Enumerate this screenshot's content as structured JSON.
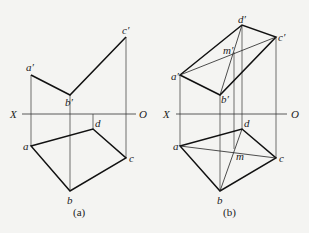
{
  "figures": [
    {
      "id": "a",
      "caption": "(a)",
      "axis": {
        "left_label": "X",
        "right_label": "O"
      },
      "front_view": {
        "points": [
          {
            "name": "a'",
            "x": 31,
            "y": 75
          },
          {
            "name": "b'",
            "x": 70,
            "y": 95
          },
          {
            "name": "c'",
            "x": 126,
            "y": 37
          }
        ]
      },
      "top_view": {
        "points": [
          {
            "name": "a",
            "x": 31,
            "y": 146
          },
          {
            "name": "b",
            "x": 70,
            "y": 191
          },
          {
            "name": "c",
            "x": 126,
            "y": 158
          },
          {
            "name": "d",
            "x": 93,
            "y": 129
          }
        ]
      }
    },
    {
      "id": "b",
      "caption": "(b)",
      "axis": {
        "left_label": "X",
        "right_label": "O"
      },
      "front_view": {
        "points": [
          {
            "name": "a'",
            "x": 180,
            "y": 75
          },
          {
            "name": "b'",
            "x": 220,
            "y": 95
          },
          {
            "name": "c'",
            "x": 276,
            "y": 37
          },
          {
            "name": "d'",
            "x": 242,
            "y": 25
          },
          {
            "name": "m'",
            "x": 234,
            "y": 52
          }
        ]
      },
      "top_view": {
        "points": [
          {
            "name": "a",
            "x": 180,
            "y": 146
          },
          {
            "name": "b",
            "x": 220,
            "y": 191
          },
          {
            "name": "c",
            "x": 276,
            "y": 158
          },
          {
            "name": "d",
            "x": 242,
            "y": 129
          },
          {
            "name": "m",
            "x": 234,
            "y": 149
          }
        ]
      }
    }
  ],
  "labels": {
    "a_X": "X",
    "a_O": "O",
    "a_ap": "a′",
    "a_bp": "b′",
    "a_cp": "c′",
    "a_a": "a",
    "a_b": "b",
    "a_c": "c",
    "a_d": "d",
    "a_cap": "(a)",
    "b_X": "X",
    "b_O": "O",
    "b_ap": "a′",
    "b_bp": "b′",
    "b_cp": "c′",
    "b_dp": "d′",
    "b_mp": "m′",
    "b_a": "a",
    "b_b": "b",
    "b_c": "c",
    "b_d": "d",
    "b_m": "m",
    "b_cap": "(b)"
  },
  "colors": {
    "line": "#1a1a1a",
    "background": "#f4f4f2"
  }
}
